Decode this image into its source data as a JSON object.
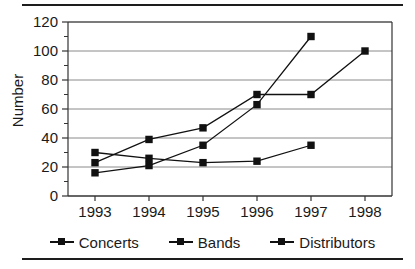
{
  "chart_data": {
    "type": "line",
    "title": "",
    "xlabel": "",
    "ylabel": "Number",
    "categories": [
      "1993",
      "1994",
      "1995",
      "1996",
      "1997",
      "1998"
    ],
    "ylim": [
      0,
      120
    ],
    "ytick_labels": [
      "0",
      "20",
      "40",
      "60",
      "80",
      "100",
      "120"
    ],
    "ytick_values": [
      0,
      20,
      40,
      60,
      80,
      100,
      120
    ],
    "minor_ytick_values": [
      10,
      30,
      50,
      70,
      90,
      110
    ],
    "grid": "horizontal",
    "legend_position": "bottom",
    "series": [
      {
        "name": "Concerts",
        "x": [
          "1993",
          "1994",
          "1995",
          "1996",
          "1997"
        ],
        "values": [
          16,
          21,
          35,
          63,
          110
        ]
      },
      {
        "name": "Bands",
        "x": [
          "1993",
          "1994",
          "1995",
          "1996",
          "1997",
          "1998"
        ],
        "values": [
          23,
          39,
          47,
          70,
          70,
          100
        ]
      },
      {
        "name": "Distributors",
        "x": [
          "1993",
          "1994",
          "1995",
          "1996",
          "1997"
        ],
        "values": [
          30,
          26,
          23,
          24,
          35
        ]
      }
    ],
    "colors": {
      "line": "#111111",
      "marker": "#111111",
      "grid": "#8a8a8a",
      "axis": "#333333",
      "background": "#ffffff"
    }
  },
  "legend": {
    "items": [
      {
        "label": "Concerts",
        "marker": "square-marker-icon"
      },
      {
        "label": "Bands",
        "marker": "square-marker-icon"
      },
      {
        "label": "Distributors",
        "marker": "square-marker-icon"
      }
    ]
  }
}
